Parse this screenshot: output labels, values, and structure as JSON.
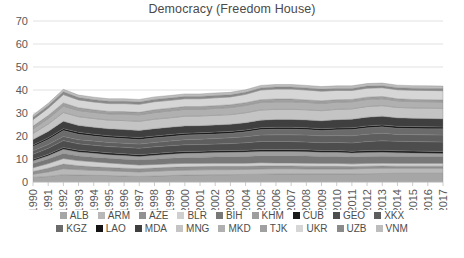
{
  "chart_data": {
    "type": "area",
    "stacked": true,
    "title": "Democracy (Freedom House)",
    "xlabel": "",
    "ylabel": "",
    "ylim": [
      0,
      70
    ],
    "ytick_step": 10,
    "yticks": [
      "0",
      "10",
      "20",
      "30",
      "40",
      "50",
      "60",
      "70"
    ],
    "grid": true,
    "legend_position": "bottom",
    "x": [
      "1990",
      "1991",
      "1992",
      "1993",
      "1994",
      "1995",
      "1996",
      "1997",
      "1998",
      "1999",
      "2000",
      "2001",
      "2002",
      "2003",
      "2004",
      "2005",
      "2006",
      "2007",
      "2008",
      "2009",
      "2010",
      "2011",
      "2012",
      "2013",
      "2014",
      "2015",
      "2016",
      "2017"
    ],
    "categories": [
      "1990",
      "1991",
      "1992",
      "1993",
      "1994",
      "1995",
      "1996",
      "1997",
      "1998",
      "1999",
      "2000",
      "2001",
      "2002",
      "2003",
      "2004",
      "2005",
      "2006",
      "2007",
      "2008",
      "2009",
      "2010",
      "2011",
      "2012",
      "2013",
      "2014",
      "2015",
      "2016",
      "2017"
    ],
    "series": [
      {
        "name": "ALB",
        "color": "#a6a6a6",
        "values": [
          2.0,
          2.4,
          3.2,
          3.0,
          2.9,
          2.8,
          2.6,
          2.4,
          2.6,
          2.8,
          3.0,
          3.1,
          3.2,
          3.2,
          3.3,
          3.4,
          3.5,
          3.5,
          3.5,
          3.5,
          3.5,
          3.5,
          3.6,
          3.7,
          3.8,
          3.8,
          3.8,
          3.8
        ]
      },
      {
        "name": "ARM",
        "color": "#b8b8b8",
        "values": [
          1.4,
          2.0,
          2.6,
          2.4,
          2.2,
          2.1,
          2.0,
          2.0,
          2.1,
          2.2,
          2.2,
          2.2,
          2.2,
          2.2,
          2.2,
          2.3,
          2.3,
          2.3,
          2.2,
          2.2,
          2.2,
          2.2,
          2.3,
          2.3,
          2.2,
          2.2,
          2.2,
          2.2
        ]
      },
      {
        "name": "AZE",
        "color": "#919191",
        "values": [
          1.2,
          1.6,
          2.0,
          1.7,
          1.5,
          1.4,
          1.4,
          1.4,
          1.4,
          1.4,
          1.4,
          1.4,
          1.4,
          1.4,
          1.3,
          1.3,
          1.2,
          1.2,
          1.2,
          1.1,
          1.1,
          1.0,
          1.0,
          1.0,
          0.9,
          0.9,
          0.9,
          0.9
        ]
      },
      {
        "name": "BLR",
        "color": "#cfcfcf",
        "values": [
          1.6,
          2.0,
          2.4,
          2.2,
          2.2,
          2.0,
          1.8,
          1.6,
          1.5,
          1.5,
          1.5,
          1.4,
          1.4,
          1.4,
          1.4,
          1.4,
          1.3,
          1.3,
          1.3,
          1.3,
          1.3,
          1.2,
          1.2,
          1.2,
          1.2,
          1.2,
          1.2,
          1.2
        ]
      },
      {
        "name": "BIH",
        "color": "#787878",
        "values": [
          1.8,
          2.0,
          2.2,
          2.0,
          2.0,
          2.0,
          2.1,
          2.2,
          2.3,
          2.4,
          2.5,
          2.6,
          2.7,
          2.8,
          2.9,
          3.0,
          3.1,
          3.1,
          3.1,
          3.0,
          3.0,
          3.0,
          3.0,
          3.0,
          3.0,
          3.0,
          3.0,
          3.0
        ]
      },
      {
        "name": "KHM",
        "color": "#9e9e9e",
        "values": [
          1.2,
          1.4,
          1.8,
          1.7,
          1.7,
          1.6,
          1.6,
          1.5,
          1.7,
          1.8,
          1.9,
          1.9,
          1.9,
          1.9,
          1.9,
          1.9,
          1.9,
          1.9,
          1.9,
          1.8,
          1.8,
          1.7,
          1.7,
          1.7,
          1.6,
          1.5,
          1.4,
          1.3
        ]
      },
      {
        "name": "CUB",
        "color": "#1a1a1a",
        "values": [
          0.7,
          0.7,
          0.8,
          0.8,
          0.8,
          0.8,
          0.8,
          0.8,
          0.8,
          0.8,
          0.8,
          0.8,
          0.8,
          0.8,
          0.8,
          0.8,
          0.8,
          0.8,
          0.8,
          0.8,
          0.8,
          0.8,
          0.9,
          0.9,
          0.9,
          0.9,
          0.9,
          0.9
        ]
      },
      {
        "name": "GEO",
        "color": "#4d4d4d",
        "values": [
          2.2,
          2.6,
          3.0,
          2.8,
          2.7,
          2.7,
          2.8,
          2.8,
          2.9,
          2.9,
          2.9,
          2.9,
          2.9,
          3.0,
          3.3,
          3.5,
          3.5,
          3.5,
          3.4,
          3.4,
          3.5,
          3.6,
          3.9,
          4.1,
          4.1,
          4.1,
          4.1,
          4.1
        ]
      },
      {
        "name": "XKX",
        "color": "#5e5e5e",
        "values": [
          1.5,
          1.6,
          1.8,
          1.8,
          1.8,
          1.8,
          1.8,
          1.8,
          1.9,
          2.0,
          2.2,
          2.3,
          2.4,
          2.5,
          2.6,
          2.8,
          2.9,
          2.9,
          3.0,
          3.0,
          3.0,
          3.1,
          3.2,
          3.3,
          3.0,
          3.0,
          3.0,
          3.0
        ]
      },
      {
        "name": "KGZ",
        "color": "#6b6b6b",
        "values": [
          1.8,
          2.2,
          2.6,
          2.4,
          2.2,
          2.1,
          2.0,
          2.0,
          2.0,
          2.0,
          2.0,
          2.0,
          2.0,
          2.0,
          2.1,
          2.4,
          2.5,
          2.5,
          2.4,
          2.3,
          2.5,
          2.7,
          2.8,
          2.8,
          2.7,
          2.7,
          2.7,
          2.7
        ]
      },
      {
        "name": "LAO",
        "color": "#141414",
        "values": [
          0.7,
          0.7,
          0.8,
          0.8,
          0.8,
          0.8,
          0.8,
          0.8,
          0.8,
          0.8,
          0.8,
          0.8,
          0.8,
          0.8,
          0.8,
          0.8,
          0.8,
          0.8,
          0.8,
          0.8,
          0.8,
          0.8,
          0.8,
          0.8,
          0.8,
          0.8,
          0.8,
          0.8
        ]
      },
      {
        "name": "MDA",
        "color": "#3f3f3f",
        "values": [
          2.4,
          2.8,
          3.2,
          3.0,
          3.0,
          3.0,
          3.1,
          3.1,
          3.2,
          3.2,
          3.2,
          3.1,
          3.1,
          3.1,
          3.2,
          3.3,
          3.4,
          3.4,
          3.4,
          3.4,
          3.6,
          3.7,
          3.8,
          3.8,
          3.7,
          3.6,
          3.6,
          3.6
        ]
      },
      {
        "name": "MNG",
        "color": "#c4c4c4",
        "values": [
          2.6,
          3.2,
          3.8,
          3.8,
          3.8,
          3.8,
          3.9,
          4.0,
          4.1,
          4.1,
          4.2,
          4.2,
          4.2,
          4.2,
          4.3,
          4.4,
          4.4,
          4.4,
          4.4,
          4.4,
          4.5,
          4.5,
          4.6,
          4.6,
          4.5,
          4.5,
          4.5,
          4.5
        ]
      },
      {
        "name": "MKD",
        "color": "#b0b0b0",
        "values": [
          2.0,
          2.4,
          2.8,
          2.7,
          2.7,
          2.7,
          2.8,
          2.8,
          2.9,
          3.0,
          3.0,
          2.9,
          3.0,
          3.1,
          3.2,
          3.3,
          3.3,
          3.3,
          3.2,
          3.2,
          3.1,
          3.1,
          3.1,
          3.0,
          2.9,
          2.8,
          2.8,
          2.8
        ]
      },
      {
        "name": "TJK",
        "color": "#a0a0a0",
        "values": [
          1.2,
          1.3,
          1.4,
          1.2,
          1.1,
          1.1,
          1.1,
          1.1,
          1.2,
          1.2,
          1.2,
          1.2,
          1.2,
          1.2,
          1.2,
          1.2,
          1.2,
          1.2,
          1.1,
          1.1,
          1.1,
          1.0,
          1.0,
          1.0,
          0.9,
          0.9,
          0.9,
          0.9
        ]
      },
      {
        "name": "UKR",
        "color": "#d6d6d6",
        "values": [
          2.8,
          3.2,
          3.6,
          3.4,
          3.4,
          3.4,
          3.5,
          3.5,
          3.5,
          3.4,
          3.4,
          3.4,
          3.4,
          3.4,
          3.6,
          4.2,
          4.3,
          4.3,
          4.3,
          4.2,
          4.0,
          3.9,
          3.9,
          3.8,
          3.9,
          4.0,
          4.0,
          4.0
        ]
      },
      {
        "name": "UZB",
        "color": "#8a8a8a",
        "values": [
          1.0,
          1.1,
          1.2,
          1.0,
          1.0,
          1.0,
          1.0,
          1.0,
          1.0,
          1.0,
          1.0,
          1.0,
          1.0,
          0.9,
          0.9,
          0.9,
          0.9,
          0.9,
          0.9,
          0.9,
          0.9,
          0.9,
          0.9,
          0.9,
          0.9,
          0.9,
          0.9,
          0.9
        ]
      },
      {
        "name": "VNM",
        "color": "#bdbdbd",
        "values": [
          1.0,
          1.0,
          1.1,
          1.1,
          1.1,
          1.1,
          1.1,
          1.1,
          1.1,
          1.1,
          1.1,
          1.1,
          1.1,
          1.1,
          1.1,
          1.1,
          1.1,
          1.1,
          1.1,
          1.1,
          1.1,
          1.1,
          1.1,
          1.1,
          1.1,
          1.1,
          1.1,
          1.1
        ]
      }
    ]
  },
  "legend": {
    "rows": [
      [
        {
          "label": "ALB",
          "color": "#a6a6a6"
        },
        {
          "label": "ARM",
          "color": "#b8b8b8"
        },
        {
          "label": "AZE",
          "color": "#919191"
        },
        {
          "label": "BLR",
          "color": "#cfcfcf"
        },
        {
          "label": "BIH",
          "color": "#787878"
        },
        {
          "label": "KHM",
          "color": "#9e9e9e"
        },
        {
          "label": "CUB",
          "color": "#1a1a1a"
        },
        {
          "label": "GEO",
          "color": "#4d4d4d"
        },
        {
          "label": "XKX",
          "color": "#5e5e5e"
        }
      ],
      [
        {
          "label": "KGZ",
          "color": "#6b6b6b"
        },
        {
          "label": "LAO",
          "color": "#141414"
        },
        {
          "label": "MDA",
          "color": "#3f3f3f"
        },
        {
          "label": "MNG",
          "color": "#c4c4c4"
        },
        {
          "label": "MKD",
          "color": "#b0b0b0"
        },
        {
          "label": "TJK",
          "color": "#a0a0a0"
        },
        {
          "label": "UKR",
          "color": "#d6d6d6"
        },
        {
          "label": "UZB",
          "color": "#8a8a8a"
        },
        {
          "label": "VNM",
          "color": "#bdbdbd"
        }
      ]
    ]
  }
}
